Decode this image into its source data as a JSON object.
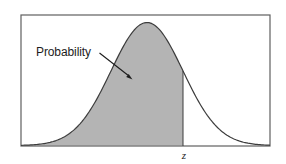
{
  "figure": {
    "probability_label": "Probability",
    "z_label": "z"
  },
  "colors": {
    "background": "#ffffff",
    "area_fill": "#b4b4b4",
    "curve_stroke": "#3c3c3c",
    "box_border": "#5f5f5f",
    "text": "#1d1d1d"
  }
}
